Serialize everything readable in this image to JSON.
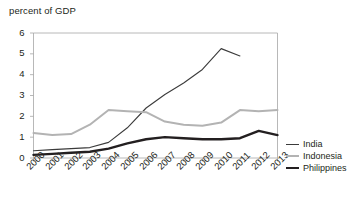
{
  "chart_data": {
    "type": "line",
    "title": "",
    "ylabel": "percent of GDP",
    "xlabel": "",
    "ylim": [
      0,
      6
    ],
    "yticks": [
      0,
      1,
      2,
      3,
      4,
      5,
      6
    ],
    "grid": false,
    "legend_position": "right",
    "categories": [
      "2000",
      "2001",
      "2002",
      "2003",
      "2004",
      "2005",
      "2006",
      "2007",
      "2008",
      "2009",
      "2010",
      "2011",
      "2012",
      "2013"
    ],
    "series": [
      {
        "name": "India",
        "color": "#3b3b3b",
        "width": 1.1,
        "values": [
          0.35,
          0.4,
          0.45,
          0.5,
          0.75,
          1.45,
          2.4,
          3.05,
          3.6,
          4.25,
          5.25,
          4.9,
          null,
          null
        ]
      },
      {
        "name": "Indonesia",
        "color": "#b3b3b3",
        "width": 2.0,
        "values": [
          1.2,
          1.1,
          1.15,
          1.6,
          2.3,
          2.25,
          2.2,
          1.75,
          1.6,
          1.55,
          1.7,
          2.3,
          2.25,
          2.3
        ]
      },
      {
        "name": "Philippines",
        "color": "#231f20",
        "width": 2.4,
        "values": [
          0.15,
          0.2,
          0.25,
          0.3,
          0.45,
          0.7,
          0.9,
          1.0,
          0.95,
          0.9,
          0.9,
          0.95,
          1.3,
          1.1
        ]
      }
    ]
  },
  "legend": {
    "items": [
      {
        "label": "India",
        "color": "#3b3b3b",
        "width": 1.1
      },
      {
        "label": "Indonesia",
        "color": "#b3b3b3",
        "width": 2.0
      },
      {
        "label": "Philippines",
        "color": "#231f20",
        "width": 2.4
      }
    ]
  },
  "axes": {
    "frame_color": "#a6a6a6",
    "tick_color": "#a6a6a6"
  }
}
